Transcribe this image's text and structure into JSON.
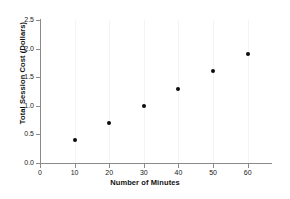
{
  "chart_data": {
    "type": "scatter",
    "title": "",
    "xlabel": "Number of Minutes",
    "ylabel": "Total Session Cost (Dollars)",
    "x": [
      10,
      20,
      30,
      40,
      50,
      60
    ],
    "y": [
      0.4,
      0.7,
      1.0,
      1.3,
      1.6,
      1.9
    ],
    "points": [
      {
        "x": 10,
        "y": 0.4
      },
      {
        "x": 20,
        "y": 0.7
      },
      {
        "x": 30,
        "y": 1.0
      },
      {
        "x": 40,
        "y": 1.3
      },
      {
        "x": 50,
        "y": 1.6
      },
      {
        "x": 60,
        "y": 1.9
      }
    ],
    "xlim": [
      0,
      65
    ],
    "ylim": [
      0.0,
      2.5
    ],
    "xticks": [
      0,
      10,
      20,
      30,
      40,
      50,
      60
    ],
    "xtick_labels": [
      "0",
      "10",
      "20",
      "30",
      "40",
      "50",
      "60"
    ],
    "yticks": [
      0.0,
      0.5,
      1.0,
      1.5,
      2.0,
      2.5
    ],
    "ytick_labels": [
      "0.0",
      "0.5",
      "1.0",
      "1.5",
      "2.0",
      "2.5"
    ],
    "grid": "vertical-only",
    "legend": "none",
    "marker_color": "#0b0b0b",
    "marker_shape": "circle",
    "axis_color": "#8a8a8a",
    "gridline_color": "#f4f4f4",
    "background_color": "#ffffff"
  }
}
